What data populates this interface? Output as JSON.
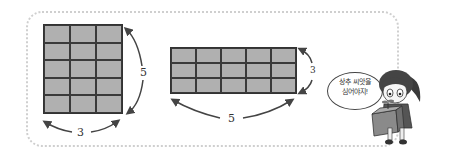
{
  "figure": {
    "left_rectangle": {
      "columns": 3,
      "rows": 5,
      "width_label": "3",
      "height_label": "5"
    },
    "right_rectangle": {
      "columns": 5,
      "rows": 3,
      "width_label": "5",
      "height_label": "3"
    }
  },
  "character": {
    "speech_line1": "상추 씨앗을",
    "speech_line2": "심어야지!"
  },
  "colors": {
    "cell_fill": "#b0b0b0",
    "grid_line": "#333333",
    "frame_border": "#cfcfcf"
  }
}
